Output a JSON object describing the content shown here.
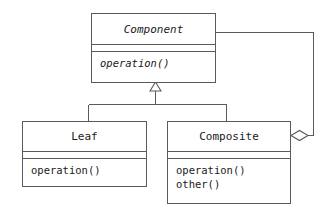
{
  "diagram": {
    "type": "uml-class-diagram",
    "pattern": "Composite",
    "background_color": "#ffffff",
    "line_color": "#5a5a5a",
    "text_color": "#1a1a1a",
    "classes": [
      {
        "id": "component",
        "name": "Component",
        "abstract": true,
        "attributes": [],
        "operations": [
          {
            "label": "operation()",
            "abstract": true
          }
        ]
      },
      {
        "id": "leaf",
        "name": "Leaf",
        "abstract": false,
        "attributes": [],
        "operations": [
          {
            "label": "operation()",
            "abstract": false
          }
        ]
      },
      {
        "id": "composite",
        "name": "Composite",
        "abstract": false,
        "attributes": [],
        "operations": [
          {
            "label": "operation()",
            "abstract": false
          },
          {
            "label": "other()",
            "abstract": false
          }
        ]
      }
    ],
    "relationships": [
      {
        "id": "leaf-generalization",
        "kind": "generalization",
        "from": "Leaf",
        "to": "Component",
        "marker": "hollow-triangle"
      },
      {
        "id": "composite-generalization",
        "kind": "generalization",
        "from": "Composite",
        "to": "Component",
        "marker": "hollow-triangle"
      },
      {
        "id": "composite-aggregation",
        "kind": "aggregation",
        "from": "Composite",
        "to": "Component",
        "marker": "hollow-diamond"
      }
    ]
  }
}
